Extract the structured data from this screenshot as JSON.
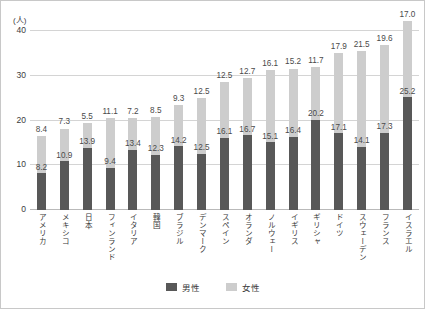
{
  "chart_data": {
    "type": "bar",
    "subtype": "stacked-bar",
    "title": "",
    "xlabel": "",
    "ylabel": "",
    "yunit": "(人)",
    "ylim": [
      0,
      40
    ],
    "yticks": [
      "0",
      "10",
      "20",
      "30",
      "40"
    ],
    "grid": true,
    "legend_position": "bottom",
    "categories": [
      "アメリカ",
      "メキシコ",
      "日本",
      "フィンランド",
      "イタリア",
      "韓国",
      "ブラジル",
      "デンマーク",
      "スペイン",
      "オランダ",
      "ノルウェー",
      "イギリス",
      "ギリシャ",
      "ドイツ",
      "スウェーデン",
      "フランス",
      "イスラエル"
    ],
    "series": [
      {
        "name": "男性",
        "color": "#585858",
        "values": [
          8.2,
          10.9,
          13.9,
          9.4,
          13.4,
          12.3,
          14.2,
          12.5,
          16.1,
          16.7,
          15.1,
          16.4,
          20.2,
          17.1,
          14.1,
          17.3,
          25.2
        ],
        "labels": [
          "8.2",
          "10.9",
          "13.9",
          "9.4",
          "13.4",
          "12.3",
          "14.2",
          "12.5",
          "16.1",
          "16.7",
          "15.1",
          "16.4",
          "20.2",
          "17.1",
          "14.1",
          "17.3",
          "25.2"
        ]
      },
      {
        "name": "女性",
        "color": "#cdcdcd",
        "values": [
          8.4,
          7.3,
          5.5,
          11.1,
          7.2,
          8.5,
          9.3,
          12.5,
          12.5,
          12.7,
          16.1,
          15.2,
          11.7,
          17.9,
          21.5,
          19.6,
          17.0
        ],
        "labels": [
          "8.4",
          "7.3",
          "5.5",
          "11.1",
          "7.2",
          "8.5",
          "9.3",
          "12.5",
          "12.5",
          "12.7",
          "16.1",
          "15.2",
          "11.7",
          "17.9",
          "21.5",
          "19.6",
          "17.0"
        ]
      }
    ]
  },
  "legend": {
    "items": [
      {
        "label": "男性",
        "color": "#585858"
      },
      {
        "label": "女性",
        "color": "#cdcdcd"
      }
    ]
  }
}
